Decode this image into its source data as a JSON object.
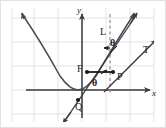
{
  "figure": {
    "canvas": {
      "width": 166,
      "height": 128,
      "background": "#ffffff"
    },
    "grid": {
      "visible": true,
      "color": "#d9d9de",
      "spacing_px": 24,
      "origin_px": {
        "x": 82,
        "y": 90
      }
    },
    "axes": {
      "color": "#3a3a3a",
      "x_label": "x",
      "y_label": "y"
    },
    "curve": {
      "name": "parabola",
      "color": "#4a4a52",
      "opens": "up",
      "vertex_px": {
        "x": 78,
        "y": 90
      }
    },
    "labels": {
      "axis_y": "y",
      "axis_x": "x",
      "directrix_line": "L",
      "tangent_line": "T",
      "focus_point": "F",
      "curve_point": "P",
      "lower_point": "Q",
      "angle_upper": "θ",
      "angle_lower": "θ"
    },
    "points": [
      {
        "name": "F",
        "label": "F",
        "x_px": 87,
        "y_px": 72
      },
      {
        "name": "P",
        "label": "P",
        "x_px": 113,
        "y_px": 72
      },
      {
        "name": "Q",
        "label": "Q",
        "x_px": 78,
        "y_px": 100
      }
    ],
    "lines": [
      {
        "name": "L",
        "style": "dashed",
        "orientation": "vertical",
        "x_px": 110,
        "color": "#8a8a92"
      },
      {
        "name": "T",
        "style": "solid",
        "kind": "tangent",
        "color": "#3a3a3a"
      },
      {
        "name": "FP",
        "style": "solid",
        "kind": "focal-radius",
        "color": "#1b1b1b"
      }
    ]
  }
}
